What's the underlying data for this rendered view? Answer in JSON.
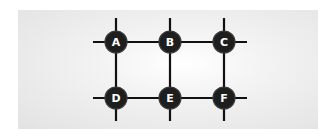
{
  "diagram": {
    "type": "grid-graph",
    "background": "#e6e6e6",
    "node_color": "#1e1e1e",
    "label_color": "#ffffff",
    "edge_color": "#111111",
    "nodes": [
      {
        "id": "A",
        "label": "A",
        "x": 116,
        "y": 42
      },
      {
        "id": "B",
        "label": "B",
        "x": 170,
        "y": 42
      },
      {
        "id": "C",
        "label": "C",
        "x": 224,
        "y": 42
      },
      {
        "id": "D",
        "label": "D",
        "x": 116,
        "y": 98
      },
      {
        "id": "E",
        "label": "E",
        "x": 170,
        "y": 98
      },
      {
        "id": "F",
        "label": "F",
        "x": 224,
        "y": 98
      }
    ],
    "edges": [
      [
        "A",
        "B"
      ],
      [
        "B",
        "C"
      ],
      [
        "D",
        "E"
      ],
      [
        "E",
        "F"
      ],
      [
        "A",
        "D"
      ],
      [
        "B",
        "E"
      ],
      [
        "C",
        "F"
      ]
    ]
  }
}
